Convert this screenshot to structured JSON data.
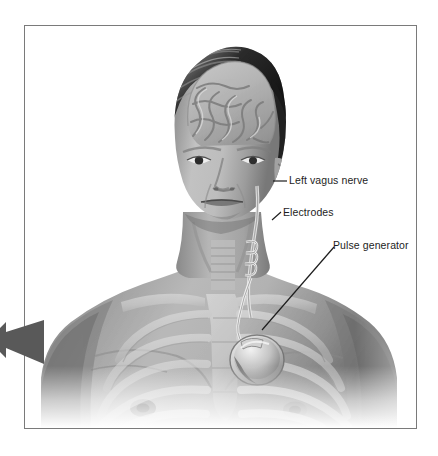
{
  "figure": {
    "style": "grayscale medical illustration",
    "background_color": "#ffffff",
    "frame_color": "#7a7a7a",
    "label_color": "#1d1d1d",
    "leader_color": "#1d1d1d",
    "arrow_color": "#595959"
  },
  "callouts": [
    {
      "id": "left-vagus-nerve",
      "label": "Left vagus nerve",
      "leader": "horizontal",
      "points_to": "nerve running down the left side of the neck"
    },
    {
      "id": "electrodes",
      "label": "Electrodes",
      "leader": "diagonal-short",
      "points_to": "helical electrode coil wrapped around the vagus nerve in the neck"
    },
    {
      "id": "pulse-generator",
      "label": "Pulse generator",
      "leader": "diagonal-long",
      "points_to": "round implanted device below the left clavicle"
    }
  ],
  "anatomy": [
    {
      "id": "brain",
      "name": "Brain"
    },
    {
      "id": "skull",
      "name": "Skull / head in cutaway"
    },
    {
      "id": "face",
      "name": "Face"
    },
    {
      "id": "neck",
      "name": "Neck"
    },
    {
      "id": "trachea",
      "name": "Trachea"
    },
    {
      "id": "clavicle",
      "name": "Clavicles"
    },
    {
      "id": "sternum",
      "name": "Sternum"
    },
    {
      "id": "ribcage",
      "name": "Ribcage"
    },
    {
      "id": "shoulders",
      "name": "Shoulders and upper arms"
    }
  ],
  "device_parts": [
    {
      "id": "generator",
      "name": "Pulse generator disc"
    },
    {
      "id": "lead",
      "name": "Lead wire"
    },
    {
      "id": "coil",
      "name": "Electrode coil"
    }
  ],
  "margin_marker": {
    "id": "margin-arrow",
    "name": "Left-pointing arrow marker",
    "description": "Dark gray arrow in the left page margin, cropped at the image edge"
  }
}
